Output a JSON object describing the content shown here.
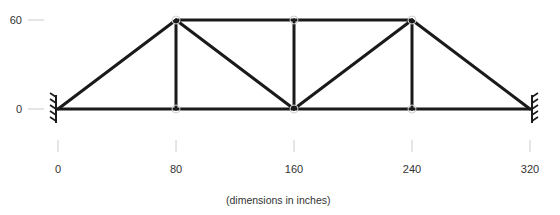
{
  "diagram": {
    "type": "truss",
    "caption": "(dimensions in inches)",
    "units": "inches",
    "colors": {
      "member": "#1a1a1a",
      "guide": "#cccccc",
      "node": "#d0d0d0",
      "text": "#333333",
      "support": "#1a1a1a"
    },
    "x_axis": {
      "ticks": [
        {
          "value": 0,
          "label": "0"
        },
        {
          "value": 80,
          "label": "80"
        },
        {
          "value": 160,
          "label": "160"
        },
        {
          "value": 240,
          "label": "240"
        },
        {
          "value": 320,
          "label": "320"
        }
      ]
    },
    "y_axis": {
      "ticks": [
        {
          "value": 60,
          "label": "60"
        },
        {
          "value": 0,
          "label": "0"
        }
      ]
    },
    "nodes": [
      {
        "id": "A",
        "x": 0,
        "y": 0
      },
      {
        "id": "B",
        "x": 80,
        "y": 0
      },
      {
        "id": "C",
        "x": 160,
        "y": 0
      },
      {
        "id": "D",
        "x": 240,
        "y": 0
      },
      {
        "id": "E",
        "x": 320,
        "y": 0
      },
      {
        "id": "F",
        "x": 80,
        "y": 60
      },
      {
        "id": "G",
        "x": 160,
        "y": 60
      },
      {
        "id": "H",
        "x": 240,
        "y": 60
      }
    ],
    "members": [
      [
        "A",
        "B"
      ],
      [
        "B",
        "C"
      ],
      [
        "C",
        "D"
      ],
      [
        "D",
        "E"
      ],
      [
        "F",
        "G"
      ],
      [
        "G",
        "H"
      ],
      [
        "A",
        "F"
      ],
      [
        "B",
        "F"
      ],
      [
        "F",
        "C"
      ],
      [
        "C",
        "G"
      ],
      [
        "C",
        "H"
      ],
      [
        "D",
        "H"
      ],
      [
        "H",
        "E"
      ]
    ],
    "supports": [
      {
        "node": "A",
        "type": "fixed-wall",
        "side": "left"
      },
      {
        "node": "E",
        "type": "fixed-wall",
        "side": "right"
      }
    ]
  }
}
